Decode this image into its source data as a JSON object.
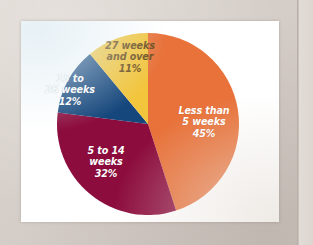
{
  "document": {
    "background_color": "#d8d1cb",
    "card_color": "#ffffff"
  },
  "chart_data": {
    "type": "pie",
    "title": "",
    "subtitle": "",
    "xlabel": "",
    "ylabel": "",
    "legend_position": "none",
    "grid": false,
    "labels_inside_slices": true,
    "start_angle_deg": 0,
    "direction": "clockwise",
    "categories": [
      "Less than 5 weeks",
      "5 to 14 weeks",
      "15 to 26 weeks",
      "27 weeks and over"
    ],
    "values": [
      45,
      32,
      12,
      11
    ],
    "value_suffix": "%",
    "colors": [
      "#e8723a",
      "#8c0c3d",
      "#16477c",
      "#f2c53d"
    ],
    "label_text_colors": [
      "#ffffff",
      "#ffffff",
      "#ffffff",
      "#6b4b18"
    ],
    "slices": [
      {
        "name": "Less than 5 weeks",
        "value": 45,
        "value_label": "45%",
        "color": "#e8723a",
        "label_lines": [
          "Less than",
          "5 weeks",
          "45%"
        ]
      },
      {
        "name": "5 to 14 weeks",
        "value": 32,
        "value_label": "32%",
        "color": "#8c0c3d",
        "label_lines": [
          "5 to 14",
          "weeks",
          "32%"
        ]
      },
      {
        "name": "15 to 26 weeks",
        "value": 12,
        "value_label": "12%",
        "color": "#16477c",
        "label_lines": [
          "15 to",
          "26 weeks",
          "12%"
        ]
      },
      {
        "name": "27 weeks and over",
        "value": 11,
        "value_label": "11%",
        "color": "#f2c53d",
        "label_lines": [
          "27 weeks",
          "and over",
          "11%"
        ]
      }
    ]
  }
}
